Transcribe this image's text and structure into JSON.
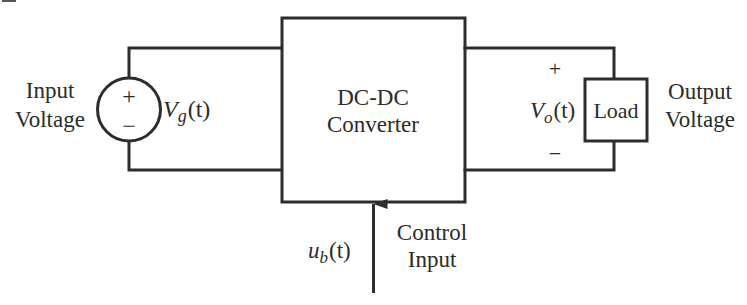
{
  "diagram": {
    "type": "block-diagram",
    "colors": {
      "line": "#2d2d2d",
      "text": "#2b2b2b",
      "background": "#ffffff"
    },
    "input_source": {
      "label_line1": "Input",
      "label_line2": "Voltage",
      "plus_sign": "+",
      "minus_sign": "−",
      "symbol_main": "V",
      "symbol_sub": "g",
      "symbol_arg": "(t)"
    },
    "converter": {
      "label_line1": "DC-DC",
      "label_line2": "Converter"
    },
    "load": {
      "label": "Load",
      "plus_sign": "+",
      "minus_sign": "−",
      "symbol_main": "V",
      "symbol_sub": "o",
      "symbol_arg": "(t)",
      "output_line1": "Output",
      "output_line2": "Voltage"
    },
    "control": {
      "symbol_main": "u",
      "symbol_sub": "b",
      "symbol_arg": "(t)",
      "label_line1": "Control",
      "label_line2": "Input"
    }
  }
}
